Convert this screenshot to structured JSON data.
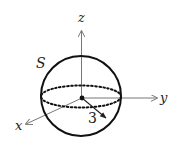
{
  "diagram": {
    "type": "sphere-axes",
    "labels": {
      "surface": "S",
      "x_axis": "x",
      "y_axis": "y",
      "z_axis": "z",
      "radius": "3"
    },
    "colors": {
      "outline": "#111111",
      "axes": "#777777",
      "text": "#222222"
    }
  }
}
